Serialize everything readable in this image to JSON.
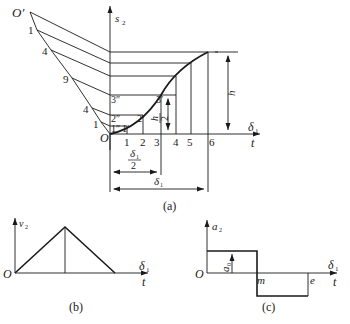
{
  "figure_a": {
    "caption": "(a)",
    "y_axis_label": "s",
    "y_axis_sub": "2",
    "x_axis_label_top": "δ",
    "x_axis_label_top_sub": "1",
    "x_axis_label_bottom": "t",
    "origin_label": "O",
    "pole_label": "O′",
    "fan_labels": [
      "1",
      "4",
      "9",
      "4",
      "1"
    ],
    "tick_labels": [
      "1",
      "2",
      "3",
      "4",
      "5",
      "6"
    ],
    "point_labels": {
      "p1dd": "1″",
      "p1d": "1′",
      "p2dd": "2″",
      "p2d": "2′",
      "p3dd": "3″",
      "p3d": "3′"
    },
    "dim_h": "h",
    "dim_h_half_num": "h",
    "dim_h_half_den": "2",
    "dim_delta_half_num": "δ",
    "dim_delta_half_sub": "1",
    "dim_delta_half_den": "2",
    "dim_delta": "δ",
    "dim_delta_sub": "1"
  },
  "figure_b": {
    "caption": "(b)",
    "y_axis_label": "v",
    "y_axis_sub": "2",
    "x_axis_label_top": "δ",
    "x_axis_label_top_sub": "1",
    "x_axis_label_bottom": "t",
    "origin_label": "O"
  },
  "figure_c": {
    "caption": "(c)",
    "y_axis_label": "a",
    "y_axis_sub": "2",
    "x_axis_label_top": "δ",
    "x_axis_label_top_sub": "1",
    "x_axis_label_bottom": "t",
    "origin_label": "O",
    "amplitude_label": "a",
    "amplitude_sub": "0",
    "mid_label": "m",
    "end_label": "e"
  },
  "colors": {
    "stroke": "#1a1a1a",
    "background": "#ffffff"
  }
}
